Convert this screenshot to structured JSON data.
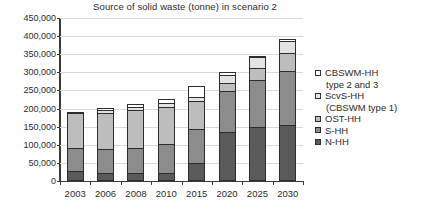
{
  "chart_data": {
    "type": "bar",
    "title": "Source of solid waste (tonne) in scenario 2",
    "xlabel": "",
    "ylabel": "",
    "stacked": true,
    "grid": true,
    "legend_position": "right",
    "ylim": [
      0,
      450000
    ],
    "yticks": [
      0,
      50000,
      100000,
      150000,
      200000,
      250000,
      300000,
      350000,
      400000,
      450000
    ],
    "ytick_labels": [
      "0",
      "50,000",
      "100,000",
      "150,000",
      "200,000",
      "250,000",
      "300,000",
      "350,000",
      "400,000",
      "450,000"
    ],
    "categories": [
      "2003",
      "2006",
      "2008",
      "2010",
      "2015",
      "2020",
      "2025",
      "2030"
    ],
    "series": [
      {
        "name": "N-HH",
        "color": "#5a5a5a",
        "values": [
          28000,
          23000,
          21000,
          22000,
          51000,
          134000,
          149000,
          154000
        ]
      },
      {
        "name": "S-HH",
        "color": "#8c8c8c",
        "values": [
          63000,
          65000,
          71000,
          80000,
          92000,
          115000,
          131000,
          151000
        ]
      },
      {
        "name": "OST-HH",
        "color": "#bdbdbd",
        "values": [
          97000,
          100000,
          103000,
          103000,
          77000,
          23000,
          33000,
          49000
        ]
      },
      {
        "name": "ScvS-HH (CBSWM type 1)",
        "color": "#e3e3e3",
        "values": [
          3000,
          8000,
          9000,
          10000,
          13000,
          22000,
          30000,
          33000
        ]
      },
      {
        "name": "CBSWM-HH type 2 and 3",
        "color": "#ffffff",
        "values": [
          0,
          7000,
          9000,
          12000,
          28000,
          8000,
          3000,
          4000
        ]
      }
    ],
    "totals": [
      191000,
      203000,
      213000,
      227000,
      261000,
      302000,
      346000,
      391000
    ]
  },
  "legend": {
    "entries": [
      {
        "label": "CBSWM-HH",
        "cont": "type 2 and 3",
        "color": "#ffffff"
      },
      {
        "label": "ScvS-HH",
        "cont": "(CBSWM type 1)",
        "color": "#e3e3e3"
      },
      {
        "label": "OST-HH",
        "cont": "",
        "color": "#bdbdbd"
      },
      {
        "label": "S-HH",
        "cont": "",
        "color": "#8c8c8c"
      },
      {
        "label": "N-HH",
        "cont": "",
        "color": "#5a5a5a"
      }
    ]
  }
}
